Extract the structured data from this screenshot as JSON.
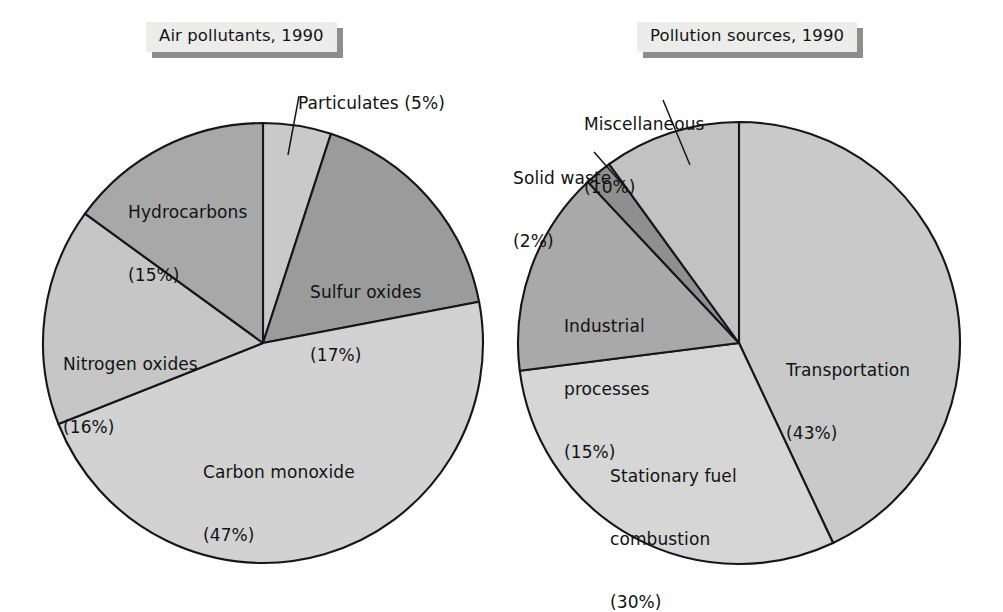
{
  "page": {
    "background": "#fefefe",
    "ink": "#121212"
  },
  "charts": [
    {
      "title": "Air pollutants, 1990",
      "center": {
        "x": 263,
        "y": 343
      },
      "radius": 220
    },
    {
      "title": "Pollution sources, 1990",
      "center": {
        "x": 739,
        "y": 343
      },
      "radius": 221
    }
  ],
  "labels": {
    "particulates": "Particulates (5%)",
    "sulfur_line1": "Sulfur oxides",
    "sulfur_line2": "(17%)",
    "carbon_line1": "Carbon monoxide",
    "carbon_line2": "(47%)",
    "nitrogen_line1": "Nitrogen oxides",
    "nitrogen_line2": "(16%)",
    "hydrocarbons_line1": "Hydrocarbons",
    "hydrocarbons_line2": "(15%)",
    "misc_line1": "Miscellaneous",
    "misc_line2": "(10%)",
    "solid_line1": "Solid waste",
    "solid_line2": "(2%)",
    "industrial_line1": "Industrial",
    "industrial_line2": "processes",
    "industrial_line3": "(15%)",
    "stationary_line1": "Stationary fuel",
    "stationary_line2": "combustion",
    "stationary_line3": "(30%)",
    "transport_line1": "Transportation",
    "transport_line2": "(43%)"
  },
  "chart_data": [
    {
      "type": "pie",
      "title": "Air pollutants, 1990",
      "xlabel": "",
      "ylabel": "",
      "legend": "none",
      "units": "percent",
      "start_angle_deg": 0,
      "direction": "clockwise",
      "categories": [
        "Particulates",
        "Sulfur oxides",
        "Carbon monoxide",
        "Nitrogen oxides",
        "Hydrocarbons"
      ],
      "values": [
        5,
        17,
        47,
        16,
        15
      ],
      "slices": [
        {
          "label": "Particulates",
          "value": 5,
          "display": "Particulates (5%)",
          "color": "#c9c9c9",
          "leader": true
        },
        {
          "label": "Sulfur oxides",
          "value": 17,
          "display": "Sulfur oxides (17%)",
          "color": "#9b9b9b",
          "leader": false
        },
        {
          "label": "Carbon monoxide",
          "value": 47,
          "display": "Carbon monoxide (47%)",
          "color": "#d2d2d2",
          "leader": false
        },
        {
          "label": "Nitrogen oxides",
          "value": 16,
          "display": "Nitrogen oxides (16%)",
          "color": "#c6c6c6",
          "leader": false
        },
        {
          "label": "Hydrocarbons",
          "value": 15,
          "display": "Hydrocarbons (15%)",
          "color": "#a8a8a8",
          "leader": false
        }
      ]
    },
    {
      "type": "pie",
      "title": "Pollution sources, 1990",
      "xlabel": "",
      "ylabel": "",
      "legend": "none",
      "units": "percent",
      "start_angle_deg": 0,
      "direction": "clockwise",
      "categories": [
        "Transportation",
        "Stationary fuel combustion",
        "Industrial processes",
        "Solid waste",
        "Miscellaneous"
      ],
      "values": [
        43,
        30,
        15,
        2,
        10
      ],
      "slices": [
        {
          "label": "Transportation",
          "value": 43,
          "display": "Transportation (43%)",
          "color": "#c9c9c9",
          "leader": false
        },
        {
          "label": "Stationary fuel combustion",
          "value": 30,
          "display": "Stationary fuel combustion (30%)",
          "color": "#d6d6d6",
          "leader": false
        },
        {
          "label": "Industrial processes",
          "value": 15,
          "display": "Industrial processes (15%)",
          "color": "#a9a9a9",
          "leader": false
        },
        {
          "label": "Solid waste",
          "value": 2,
          "display": "Solid waste (2%)",
          "color": "#8f8f8f",
          "leader": true
        },
        {
          "label": "Miscellaneous",
          "value": 10,
          "display": "Miscellaneous (10%)",
          "color": "#c2c2c2",
          "leader": true
        }
      ]
    }
  ]
}
